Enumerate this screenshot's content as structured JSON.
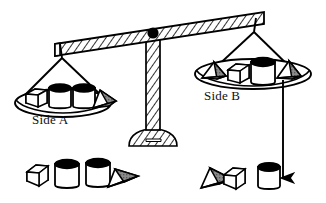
{
  "figure": {
    "type": "balance-scale-diagram",
    "title": "",
    "labels": {
      "side_a": "Side A",
      "side_b": "Side B"
    },
    "balance_state": "side-b-down",
    "arrow": {
      "name": "down-arrow",
      "direction": "down",
      "meaning": "Side B is heavier"
    },
    "pan_a": {
      "name": "Side A",
      "items": [
        {
          "shape": "box",
          "fill": "white"
        },
        {
          "shape": "cylinder",
          "fill": "white"
        },
        {
          "shape": "cylinder",
          "fill": "white"
        },
        {
          "shape": "pyramid",
          "fill": "shaded"
        }
      ],
      "counts": {
        "box": 1,
        "cylinder": 2,
        "pyramid": 1
      }
    },
    "pan_b": {
      "name": "Side B",
      "items": [
        {
          "shape": "pyramid",
          "fill": "shaded"
        },
        {
          "shape": "box",
          "fill": "white"
        },
        {
          "shape": "cylinder",
          "fill": "white"
        },
        {
          "shape": "pyramid",
          "fill": "shaded"
        }
      ],
      "counts": {
        "box": 1,
        "cylinder": 1,
        "pyramid": 2
      }
    },
    "legend_a": {
      "name": "Side A contents key",
      "items": [
        {
          "shape": "box",
          "fill": "white"
        },
        {
          "shape": "cylinder",
          "fill": "white"
        },
        {
          "shape": "cylinder",
          "fill": "white"
        },
        {
          "shape": "pyramid",
          "fill": "shaded"
        }
      ]
    },
    "legend_b": {
      "name": "Side B contents key",
      "items": [
        {
          "shape": "pyramid",
          "fill": "shaded"
        },
        {
          "shape": "box",
          "fill": "white"
        },
        {
          "shape": "cylinder",
          "fill": "white"
        }
      ]
    },
    "colors": {
      "outline": "#000000",
      "background": "#ffffff",
      "shaded_face": "#808080",
      "cylinder_top": "#000000",
      "hatch": "#000000"
    }
  }
}
